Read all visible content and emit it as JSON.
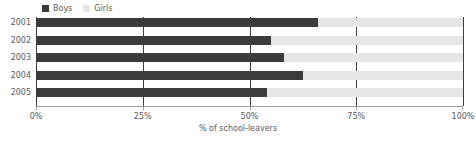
{
  "chart_data": {
    "type": "bar",
    "orientation": "horizontal",
    "stacked": true,
    "stack_total": 100,
    "title": "",
    "subtitle": "",
    "xlabel": "% of school-leavers",
    "ylabel": "",
    "categories": [
      "2001",
      "2002",
      "2003",
      "2004",
      "2005"
    ],
    "series": [
      {
        "name": "Boys",
        "color": "#3b3b3b",
        "values": [
          66,
          55,
          58,
          62.5,
          54
        ]
      },
      {
        "name": "Girls",
        "color": "#e6e6e6",
        "values": [
          34,
          45,
          42,
          37.5,
          46
        ]
      }
    ],
    "xlim": [
      0,
      100
    ],
    "xticks": [
      0,
      25,
      50,
      75,
      100
    ],
    "xtick_labels": [
      "0%",
      "25%",
      "50%",
      "75%",
      "100%"
    ],
    "grid": true,
    "grid_axis": "x",
    "grid_color": "#3f3f3f",
    "legend_position": "top-left",
    "annotations": []
  },
  "legend": {
    "items": [
      {
        "label": "Boys",
        "swatch": "legend-swatch-boys"
      },
      {
        "label": "Girls",
        "swatch": "legend-swatch-girls"
      }
    ]
  },
  "axes": {
    "y_labels": [
      "2001",
      "2002",
      "2003",
      "2004",
      "2005"
    ],
    "x_labels": [
      "0%",
      "25%",
      "50%",
      "75%",
      "100%"
    ],
    "x_title": "% of school-leavers"
  },
  "colors": {
    "boys": "#3b3b3b",
    "girls": "#e6e6e6",
    "grid": "#3f3f3f",
    "axis": "#9a9a9a",
    "text": "#5a5a5a",
    "background": "#ffffff"
  }
}
